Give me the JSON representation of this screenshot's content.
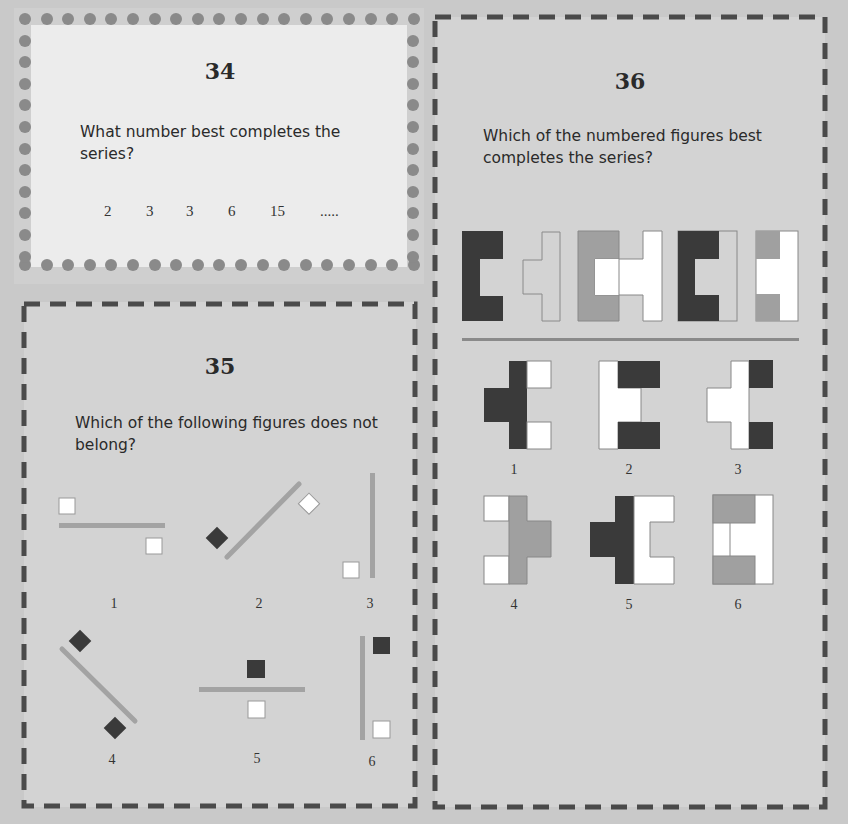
{
  "colors": {
    "page_bg": "#c9c9c9",
    "panel_34_bg": "#ececec",
    "dot": "#8a8a8a",
    "dash": "#4a4a4a",
    "dark": "#3a3a3a",
    "mid": "#a0a0a0",
    "white": "#ffffff",
    "line": "#a3a3a3"
  },
  "q34": {
    "number": "34",
    "question": "What number best completes the series?",
    "question_line1": "What number best completes the",
    "question_line2": "series?",
    "series": [
      "2",
      "3",
      "3",
      "6",
      "15",
      "....."
    ]
  },
  "q35": {
    "number": "35",
    "question_line1": "Which of the following figures does not",
    "question_line2": "belong?",
    "figures": [
      {
        "label": "1",
        "desc": "horizontal bar, white square above-left, white square below-right"
      },
      {
        "label": "2",
        "desc": "diagonal bar rising right, dark diamond lower-left, white diamond upper-right"
      },
      {
        "label": "3",
        "desc": "vertical bar, white square lower-left"
      },
      {
        "label": "4",
        "desc": "diagonal bar falling right, dark diamond upper-left, dark diamond lower-right"
      },
      {
        "label": "5",
        "desc": "horizontal bar, dark square above, white square below"
      },
      {
        "label": "6",
        "desc": "vertical bar, dark square upper-right, white square lower-right"
      }
    ]
  },
  "q36": {
    "number": "36",
    "question_line1": "Which of the numbered figures best",
    "question_line2": "completes the series?",
    "series_figures": [
      {
        "desc": "dark C shape"
      },
      {
        "desc": "outlined T shape"
      },
      {
        "desc": "grey C and white T combined"
      },
      {
        "desc": "dark C with outlined strip"
      },
      {
        "desc": "grey blocks with white H"
      }
    ],
    "options": [
      {
        "label": "1"
      },
      {
        "label": "2"
      },
      {
        "label": "3"
      },
      {
        "label": "4"
      },
      {
        "label": "5"
      },
      {
        "label": "6"
      }
    ]
  }
}
